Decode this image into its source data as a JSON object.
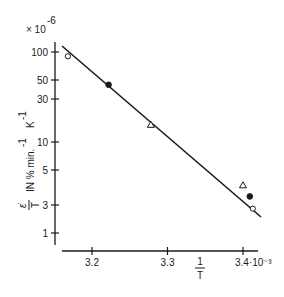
{
  "chart_data": {
    "type": "scatter",
    "title": "",
    "scale_factor_y": "× 10⁻⁶",
    "xlabel": "1/T",
    "xlabel_numerator": "1",
    "xlabel_denominator": "T",
    "x_scale_suffix": "·10⁻³",
    "ylabel": "ε̇/T IN % min.⁻¹ K⁻¹",
    "ylabel_parts": {
      "frac_num": "ε̇",
      "frac_den": "T",
      "text": "IN  % min.",
      "sup1": "-1",
      "unit": "K",
      "sup2": "-1"
    },
    "yscale": "log",
    "xlim": [
      3.16,
      3.42
    ],
    "ylim": [
      1,
      110
    ],
    "x_ticks": [
      {
        "value": 3.2,
        "label": "3.2"
      },
      {
        "value": 3.3,
        "label": "3.3"
      },
      {
        "value": 3.4,
        "label": "3.4·10⁻³"
      }
    ],
    "y_ticks": [
      {
        "value": 100,
        "label": "100"
      },
      {
        "value": 50,
        "label": "50"
      },
      {
        "value": 30,
        "label": "30"
      },
      {
        "value": 10,
        "label": "10"
      },
      {
        "value": 5,
        "label": "5"
      },
      {
        "value": 3,
        "label": "3"
      },
      {
        "value": 1,
        "label": "1"
      }
    ],
    "grid": false,
    "legend": null,
    "series": [
      {
        "name": "open circles",
        "marker": "circle-open",
        "points": [
          {
            "x": 3.168,
            "y": 90
          },
          {
            "x": 3.413,
            "y": 2.6
          }
        ]
      },
      {
        "name": "filled circles",
        "marker": "circle-filled",
        "points": [
          {
            "x": 3.222,
            "y": 44
          },
          {
            "x": 3.409,
            "y": 3.4
          }
        ]
      },
      {
        "name": "open triangles",
        "marker": "triangle-open",
        "points": [
          {
            "x": 3.278,
            "y": 15.5
          },
          {
            "x": 3.4,
            "y": 4.0
          }
        ]
      }
    ],
    "fit_line": {
      "x_start": 3.17,
      "y_start": 110,
      "x_end": 3.42,
      "y_end": 2.4
    }
  }
}
